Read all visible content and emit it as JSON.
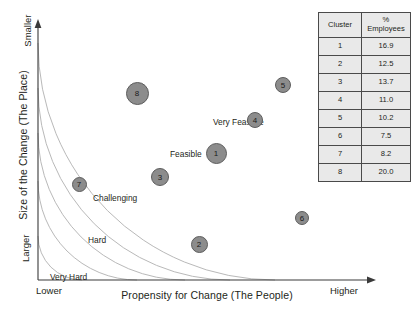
{
  "chart_data": {
    "type": "scatter",
    "title": "",
    "xlabel": "Propensity for Change (The People)",
    "ylabel": "Size of the Change (The Place)",
    "x_axis_low_label": "Lower",
    "x_axis_high_label": "Higher",
    "y_axis_top_label": "Smaller",
    "y_axis_bottom_label": "Larger",
    "grid": false,
    "legend": "none",
    "zones": [
      {
        "label": "Very Feasible",
        "x": 213,
        "y": 117
      },
      {
        "label": "Feasible",
        "x": 170,
        "y": 149
      },
      {
        "label": "Challenging",
        "x": 93,
        "y": 193
      },
      {
        "label": "Hard",
        "x": 88,
        "y": 235
      },
      {
        "label": "Very Hard",
        "x": 50,
        "y": 272
      }
    ],
    "bubbles": [
      {
        "cluster": "1",
        "cx": 216,
        "cy": 153,
        "d": 21,
        "zone": "Feasible"
      },
      {
        "cluster": "2",
        "cx": 199,
        "cy": 244,
        "d": 17,
        "zone": "Hard"
      },
      {
        "cluster": "3",
        "cx": 160,
        "cy": 177,
        "d": 18,
        "zone": "Challenging"
      },
      {
        "cluster": "4",
        "cx": 255,
        "cy": 120,
        "d": 16,
        "zone": "Very Feasible"
      },
      {
        "cluster": "5",
        "cx": 283,
        "cy": 85,
        "d": 16,
        "zone": "Very Feasible"
      },
      {
        "cluster": "6",
        "cx": 302,
        "cy": 218,
        "d": 14,
        "zone": "Challenging"
      },
      {
        "cluster": "7",
        "cx": 79,
        "cy": 184,
        "d": 15,
        "zone": "Challenging"
      },
      {
        "cluster": "8",
        "cx": 137,
        "cy": 93,
        "d": 23,
        "zone": "Very Feasible"
      }
    ],
    "bubble_fill_color": "#8c8c8c",
    "bubble_stroke_color": "#5d5d5d",
    "arc_color": "#b4b4b4",
    "axis_color": "#3a3a3a"
  },
  "table": {
    "headers": [
      "Cluster",
      "% Employees"
    ],
    "header_pct_line1": "%",
    "header_pct_line2": "Employees",
    "rows": [
      {
        "cluster": "1",
        "pct": "16.9"
      },
      {
        "cluster": "2",
        "pct": "12.5"
      },
      {
        "cluster": "3",
        "pct": "13.7"
      },
      {
        "cluster": "4",
        "pct": "11.0"
      },
      {
        "cluster": "5",
        "pct": "10.2"
      },
      {
        "cluster": "6",
        "pct": "7.5"
      },
      {
        "cluster": "7",
        "pct": "8.2"
      },
      {
        "cluster": "8",
        "pct": "20.0"
      }
    ]
  }
}
